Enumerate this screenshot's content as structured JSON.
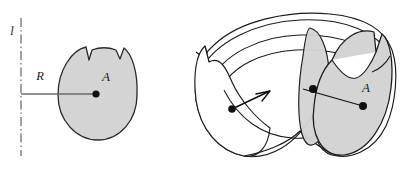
{
  "figure": {
    "canvas": {
      "width": 402,
      "height": 169,
      "background": "#ffffff"
    },
    "colors": {
      "region_fill": "#d4d4d4",
      "outline": "#1a1a1a",
      "axis_line": "#555555",
      "radius_line": "#6b6b6b",
      "label_color": "#1a1a1a",
      "solid_fill_white": "#ffffff"
    },
    "labels": {
      "axis": "l",
      "radius": "R",
      "region_left": "A",
      "region_right": "A"
    },
    "label_positions": {
      "axis": {
        "x": 12,
        "y": 35
      },
      "radius": {
        "x": 40,
        "y": 80
      },
      "region_left": {
        "x": 106,
        "y": 81
      },
      "region_right": {
        "x": 366,
        "y": 92
      }
    },
    "left_panel": {
      "name": "planar-region-panel",
      "axis": {
        "name": "axis-of-revolution",
        "style": "dash-dot",
        "x": 21,
        "y_top": 18,
        "y_bottom": 156
      },
      "radius_segment": {
        "name": "radius-segment",
        "from": {
          "x": 21,
          "y": 94
        },
        "to": {
          "x": 96,
          "y": 94
        }
      },
      "centroid_dot": {
        "x": 96,
        "y": 94,
        "r": 3.6
      },
      "region_bbox": {
        "x": 58,
        "y": 47,
        "width": 80,
        "height": 94
      }
    },
    "right_panel": {
      "name": "solid-of-revolution-panel",
      "centroid_dot_near": {
        "x": 232,
        "y": 109,
        "r": 3.6
      },
      "centroid_dot_mid": {
        "x": 313,
        "y": 89,
        "r": 4.0
      },
      "centroid_dot_far": {
        "x": 363,
        "y": 106,
        "r": 4.0
      },
      "arrow_tip": {
        "x": 268,
        "y": 93
      },
      "bbox": {
        "x": 193,
        "y": 12,
        "width": 200,
        "height": 148
      }
    }
  }
}
